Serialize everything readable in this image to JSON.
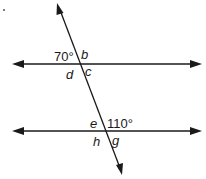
{
  "diagram": {
    "type": "parallel lines cut by transversal",
    "angles": {
      "top_left": "70°",
      "top_right": "b",
      "bottom_left_upper": "d",
      "bottom_right_upper": "c",
      "lower_top_left": "e",
      "lower_top_right": "110°",
      "lower_bottom_left": "h",
      "lower_bottom_right": "g"
    },
    "colors": {
      "line": "#1a1a1a",
      "background": "#ffffff"
    }
  }
}
